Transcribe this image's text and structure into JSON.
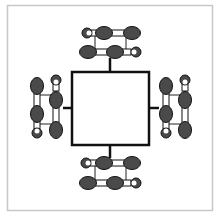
{
  "diagram": {
    "title": "",
    "colors": {
      "frame": "#c8c8c8",
      "square_stroke": "#111111",
      "lobe_fill": "#4a4a4a",
      "lobe_stroke": "#111111",
      "bond_fill": "#ffffff",
      "link_line": "#222222"
    },
    "frame": {
      "x": 7,
      "y": 5,
      "width": 206,
      "height": 206
    },
    "center_square": {
      "x": 72,
      "y": 72,
      "width": 77,
      "height": 73
    },
    "groups": [
      {
        "name": "top",
        "orientation": "horizontal",
        "stem": [
          110,
          72,
          110,
          60
        ]
      },
      {
        "name": "bottom",
        "orientation": "horizontal",
        "stem": [
          110,
          145,
          110,
          157
        ]
      },
      {
        "name": "left",
        "orientation": "vertical",
        "stem": [
          72,
          108,
          62,
          108
        ]
      },
      {
        "name": "right",
        "orientation": "vertical",
        "stem": [
          149,
          108,
          159,
          108
        ]
      }
    ]
  }
}
